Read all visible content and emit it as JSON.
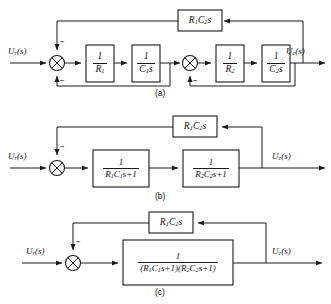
{
  "figure": {
    "captions": {
      "a": "(a)",
      "b": "(b)",
      "c": "(c)"
    }
  },
  "signals": {
    "input": "U",
    "input_sub": "r",
    "input_suffix": "(s)",
    "output": "U",
    "output_sub": "c",
    "output_suffix": "(s)"
  },
  "signs": {
    "minus": "−"
  },
  "diagram_a": {
    "name": "(a)",
    "input_label": "U",
    "output_label": "U",
    "blocks": [
      {
        "id": "inv-r1",
        "num": "1",
        "den": "R",
        "den_sub": "1",
        "den_tail": ""
      },
      {
        "id": "inv-c1s",
        "num": "1",
        "den": "C",
        "den_sub": "1",
        "den_tail": "s"
      },
      {
        "id": "inv-r2",
        "num": "1",
        "den": "R",
        "den_sub": "2",
        "den_tail": ""
      },
      {
        "id": "inv-c2s",
        "num": "1",
        "den": "C",
        "den_sub": "2",
        "den_tail": "s"
      }
    ],
    "feedback_block": {
      "id": "r1c2s",
      "pre": "R",
      "pre_sub": "1",
      "mid": "C",
      "mid_sub": "2",
      "tail": "s"
    },
    "summing_junctions": [
      {
        "id": "sum-1",
        "signs": [
          "−",
          "−"
        ]
      },
      {
        "id": "sum-2",
        "signs": [
          "−"
        ]
      }
    ]
  },
  "diagram_b": {
    "name": "(b)",
    "input_label": "U",
    "output_label": "U",
    "blocks": [
      {
        "id": "lag-1",
        "num": "1",
        "d_r": "R",
        "d_r_sub": "1",
        "d_c": "C",
        "d_c_sub": "1",
        "d_tail": "s+1"
      },
      {
        "id": "lag-2",
        "num": "1",
        "d_r": "R",
        "d_r_sub": "2",
        "d_c": "C",
        "d_c_sub": "2",
        "d_tail": "s+1"
      }
    ],
    "feedback_block": {
      "id": "r1c2s",
      "pre": "R",
      "pre_sub": "1",
      "mid": "C",
      "mid_sub": "2",
      "tail": "s"
    },
    "summing_junctions": [
      {
        "id": "sum-1",
        "signs": [
          "−"
        ]
      }
    ]
  },
  "diagram_c": {
    "name": "(c)",
    "input_label": "U",
    "output_label": "U",
    "forward_block": {
      "id": "combined-lag",
      "num": "1",
      "den_open1": "(",
      "den_r1": "R",
      "den_r1_sub": "1",
      "den_c1": "C",
      "den_c1_sub": "1",
      "den_tail1": "s+1)",
      "den_open2": "(",
      "den_r2": "R",
      "den_r2_sub": "2",
      "den_c2": "C",
      "den_c2_sub": "2",
      "den_tail2": "s+1)"
    },
    "feedback_block": {
      "id": "r1c2s",
      "pre": "R",
      "pre_sub": "1",
      "mid": "C",
      "mid_sub": "2",
      "tail": "s"
    },
    "summing_junctions": [
      {
        "id": "sum-1",
        "signs": [
          "−"
        ]
      }
    ]
  }
}
